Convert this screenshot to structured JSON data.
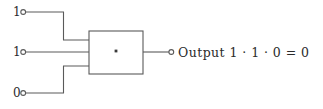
{
  "diagram": {
    "kind": "logic-gate-diagram",
    "gate": {
      "name": "and-gate",
      "symbol": "·",
      "box": {
        "x": 89,
        "y": 31,
        "width": 54,
        "height": 43
      }
    },
    "stroke_color": "#5a5a5a",
    "text_color": "#2b2b2b",
    "background_color": "#ffffff",
    "inputs": [
      {
        "name": "input-0",
        "label": "1",
        "terminal_x": 25,
        "terminal_y": 12,
        "gate_y": 40
      },
      {
        "name": "input-1",
        "label": "1",
        "terminal_x": 25,
        "terminal_y": 52,
        "gate_y": 52
      },
      {
        "name": "input-2",
        "label": "0",
        "terminal_x": 25,
        "terminal_y": 93,
        "gate_y": 66
      }
    ],
    "output": {
      "name": "output",
      "terminal_x": 170,
      "terminal_y": 52,
      "label": "Output 1 · 1 · 0  =  0",
      "expression_operands": [
        "1",
        "1",
        "0"
      ],
      "expression_operator": "·",
      "result": "0"
    }
  }
}
